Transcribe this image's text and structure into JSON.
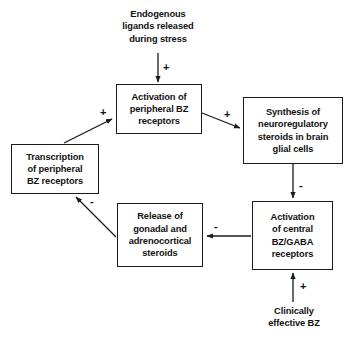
{
  "diagram": {
    "stroke_color": "#1a1a1a",
    "text_color": "#111111",
    "background_color": "#ffffff",
    "nodes": [
      {
        "id": "endogenous-ligands",
        "label": "Endogenous\nligands released\nduring stress",
        "line1": "Endogenous",
        "line2": "ligands released",
        "line3": "during stress",
        "boxed": false
      },
      {
        "id": "activation-peripheral-bz",
        "label": "Activation of\nperipheral BZ\nreceptors",
        "line1": "Activation of",
        "line2": "peripheral BZ",
        "line3": "receptors",
        "boxed": true
      },
      {
        "id": "synthesis-neuroregulatory-steroids",
        "label": "Synthesis of\nneuroregulatory\nsteroids in brain\nglial cells",
        "line1": "Synthesis of",
        "line2": "neuroregulatory",
        "line3": "steroids in brain",
        "line4": "glial cells",
        "boxed": true
      },
      {
        "id": "transcription-peripheral-bz",
        "label": "Transcription\nof peripheral\nBZ receptors",
        "line1": "Transcription",
        "line2": "of peripheral",
        "line3": "BZ receptors",
        "boxed": true
      },
      {
        "id": "release-gonadal-adrenocortical",
        "label": "Release of\ngonadal and\nadrenocortical\nsteroids",
        "line1": "Release of",
        "line2": "gonadal and",
        "line3": "adrenocortical",
        "line4": "steroids",
        "boxed": true
      },
      {
        "id": "activation-central-bz-gaba",
        "label": "Activation\nof central\nBZ/GABA\nreceptors",
        "line1": "Activation",
        "line2": "of central",
        "line3": "BZ/GABA",
        "line4": "receptors",
        "boxed": true
      },
      {
        "id": "clinically-effective-bz",
        "label": "Clinically\neffective BZ",
        "line1": "Clinically",
        "line2": "effective BZ",
        "boxed": false
      }
    ],
    "edges": [
      {
        "id": "edge-ligands-to-peripheral",
        "from": "endogenous-ligands",
        "to": "activation-peripheral-bz",
        "sign": "+"
      },
      {
        "id": "edge-peripheral-to-synthesis",
        "from": "activation-peripheral-bz",
        "to": "synthesis-neuroregulatory-steroids",
        "sign": "+"
      },
      {
        "id": "edge-synthesis-to-central",
        "from": "synthesis-neuroregulatory-steroids",
        "to": "activation-central-bz-gaba",
        "sign": "-"
      },
      {
        "id": "edge-central-to-release",
        "from": "activation-central-bz-gaba",
        "to": "release-gonadal-adrenocortical",
        "sign": "-"
      },
      {
        "id": "edge-release-to-transcription",
        "from": "release-gonadal-adrenocortical",
        "to": "transcription-peripheral-bz",
        "sign": "-"
      },
      {
        "id": "edge-transcription-to-peripheral",
        "from": "transcription-peripheral-bz",
        "to": "activation-peripheral-bz",
        "sign": "+"
      },
      {
        "id": "edge-clinical-to-central",
        "from": "clinically-effective-bz",
        "to": "activation-central-bz-gaba",
        "sign": "+"
      }
    ]
  }
}
